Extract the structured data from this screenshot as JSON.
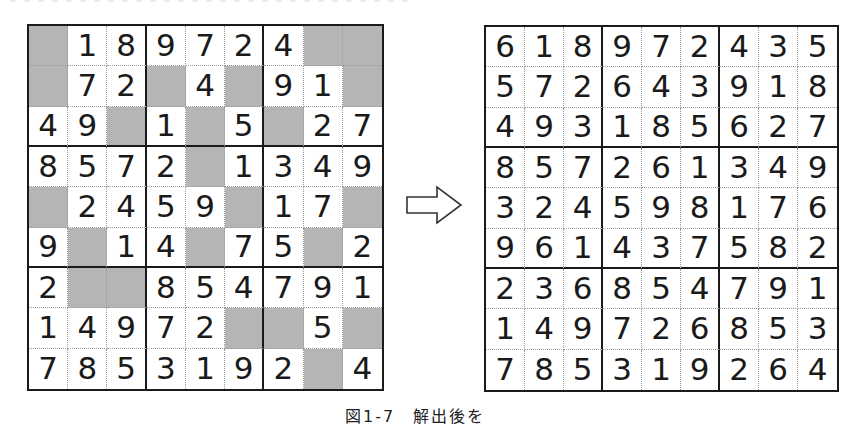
{
  "figure": {
    "caption": "図1-7　解出後を",
    "arrow": "right-arrow-outline",
    "colors": {
      "shade": "#b5b5b5",
      "line": "#1a1a1a",
      "background": "#ffffff"
    }
  },
  "puzzle": {
    "label": "unsolved",
    "rows": [
      [
        "",
        "1",
        "8",
        "9",
        "7",
        "2",
        "4",
        "",
        ""
      ],
      [
        "",
        "7",
        "2",
        "",
        "4",
        "",
        "9",
        "1",
        ""
      ],
      [
        "4",
        "9",
        "",
        "1",
        "",
        "5",
        "",
        "2",
        "7"
      ],
      [
        "8",
        "5",
        "7",
        "2",
        "",
        "1",
        "3",
        "4",
        "9"
      ],
      [
        "",
        "2",
        "4",
        "5",
        "9",
        "",
        "1",
        "7",
        ""
      ],
      [
        "9",
        "",
        "1",
        "4",
        "",
        "7",
        "5",
        "",
        "2"
      ],
      [
        "2",
        "",
        "",
        "8",
        "5",
        "4",
        "7",
        "9",
        "1"
      ],
      [
        "1",
        "4",
        "9",
        "7",
        "2",
        "",
        "",
        "5",
        ""
      ],
      [
        "7",
        "8",
        "5",
        "3",
        "1",
        "9",
        "2",
        "",
        "4"
      ]
    ]
  },
  "solution": {
    "label": "solved",
    "rows": [
      [
        "6",
        "1",
        "8",
        "9",
        "7",
        "2",
        "4",
        "3",
        "5"
      ],
      [
        "5",
        "7",
        "2",
        "6",
        "4",
        "3",
        "9",
        "1",
        "8"
      ],
      [
        "4",
        "9",
        "3",
        "1",
        "8",
        "5",
        "6",
        "2",
        "7"
      ],
      [
        "8",
        "5",
        "7",
        "2",
        "6",
        "1",
        "3",
        "4",
        "9"
      ],
      [
        "3",
        "2",
        "4",
        "5",
        "9",
        "8",
        "1",
        "7",
        "6"
      ],
      [
        "9",
        "6",
        "1",
        "4",
        "3",
        "7",
        "5",
        "8",
        "2"
      ],
      [
        "2",
        "3",
        "6",
        "8",
        "5",
        "4",
        "7",
        "9",
        "1"
      ],
      [
        "1",
        "4",
        "9",
        "7",
        "2",
        "6",
        "8",
        "5",
        "3"
      ],
      [
        "7",
        "8",
        "5",
        "3",
        "1",
        "9",
        "2",
        "6",
        "4"
      ]
    ]
  }
}
